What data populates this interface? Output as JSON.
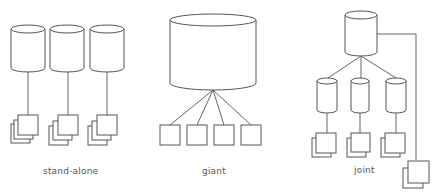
{
  "diagram": {
    "sections": [
      {
        "id": "stand-alone",
        "label": "stand-alone",
        "databases": 3,
        "clients_per_database": 1,
        "client_stack_depth": 3
      },
      {
        "id": "giant",
        "label": "giant",
        "databases": 1,
        "clients": 4,
        "client_stack_depth": 1
      },
      {
        "id": "joint",
        "label": "joint",
        "central_database": 1,
        "sub_databases": 3,
        "client_stack_depth": 2,
        "direct_clients": 1
      }
    ],
    "colors": {
      "stroke": "#555555",
      "background": "#ffffff",
      "label": "#555555"
    }
  }
}
